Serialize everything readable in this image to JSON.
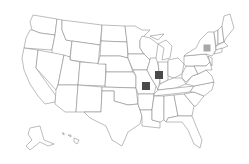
{
  "map": {
    "type": "us-states-outline",
    "background": "#ffffff",
    "state_fill": "#ffffff",
    "state_stroke": "#7a7a7a"
  },
  "markers": [
    {
      "id": "marker-illinois",
      "region": "Illinois",
      "x": 159,
      "y": 75,
      "size": 8,
      "color": "#4a4a4a"
    },
    {
      "id": "marker-missouri",
      "region": "Missouri",
      "x": 146,
      "y": 86,
      "size": 8,
      "color": "#4a4a4a"
    },
    {
      "id": "marker-new-york",
      "region": "New York",
      "x": 207,
      "y": 48,
      "size": 7,
      "color": "#a8a8a8"
    }
  ]
}
